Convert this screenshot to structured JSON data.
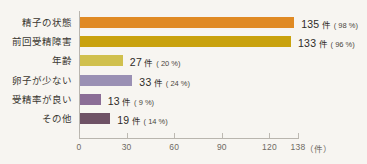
{
  "chart_data": {
    "type": "bar",
    "orientation": "horizontal",
    "title": "",
    "subtitle": "",
    "xlabel": "件",
    "ylabel": "",
    "categories": [
      "精子の状態",
      "前回受精障害",
      "年齢",
      "卵子が少ない",
      "受精率が良い",
      "その他"
    ],
    "values": [
      135,
      133,
      27,
      33,
      13,
      19
    ],
    "percent_values": [
      98,
      96,
      20,
      24,
      9,
      14
    ],
    "value_labels": [
      "135 件",
      "133 件",
      "27 件",
      "33 件",
      "13 件",
      "19 件"
    ],
    "percent_labels": [
      "( 98 %)",
      "( 96 %)",
      "( 20 %)",
      "( 24 %)",
      "( 9 %)",
      "( 14 %)"
    ],
    "counts": [
      "135",
      "133",
      "27",
      "33",
      "13",
      "19"
    ],
    "unit": "件",
    "xlim": [
      0,
      138
    ],
    "xticks": [
      0,
      30,
      60,
      90,
      120,
      138
    ],
    "xtick_labels": [
      "0",
      "30",
      "60",
      "90",
      "120",
      "138"
    ],
    "axis_unit_label": "（件）",
    "grid": false,
    "legend": false,
    "bar_colors": [
      "#e08a24",
      "#c9a20e",
      "#d0c04e",
      "#9a90b4",
      "#8b6d96",
      "#6f5266"
    ],
    "background_color": "#f7f5f1",
    "axis_color": "#b9b5ae",
    "text_color": "#2e2b27"
  }
}
